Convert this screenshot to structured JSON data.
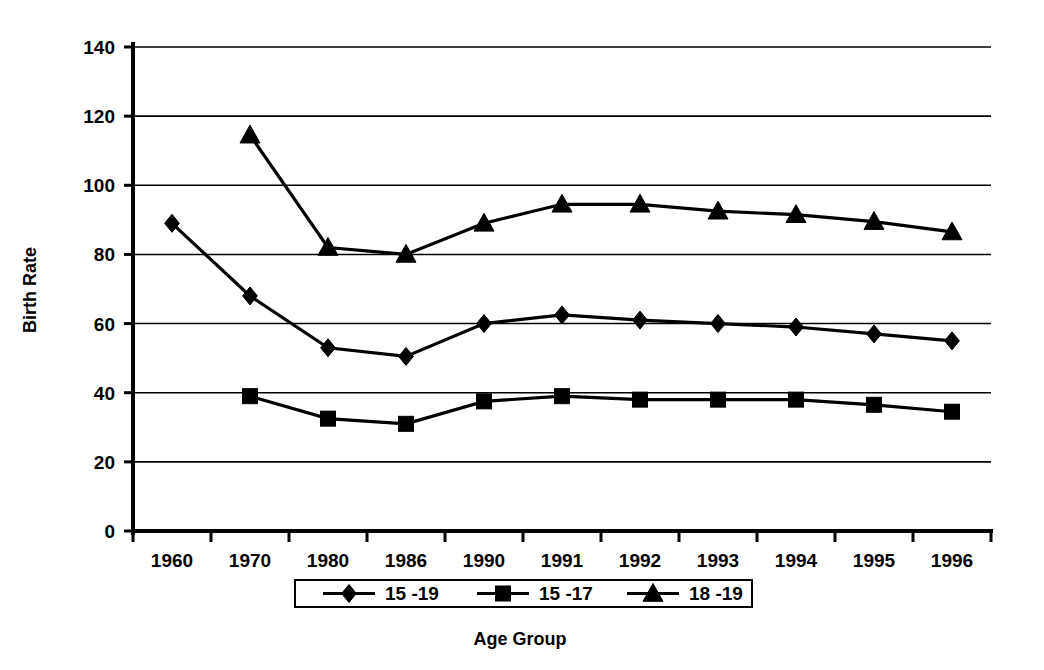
{
  "chart_data": {
    "type": "line",
    "title": "",
    "xlabel": "Age Group",
    "ylabel": "Birth Rate",
    "categories": [
      "1960",
      "1970",
      "1980",
      "1986",
      "1990",
      "1991",
      "1992",
      "1993",
      "1994",
      "1995",
      "1996"
    ],
    "ylim": [
      0,
      140
    ],
    "yticks": [
      "0",
      "20",
      "40",
      "60",
      "80",
      "100",
      "120",
      "140"
    ],
    "ytick_values": [
      0,
      20,
      40,
      60,
      80,
      100,
      120,
      140
    ],
    "grid": "horizontal",
    "legend_position": "bottom",
    "series": [
      {
        "name": "15 -19",
        "marker": "diamond",
        "values": [
          89,
          68,
          53,
          50.5,
          60,
          62.5,
          61,
          60,
          59,
          57,
          55
        ]
      },
      {
        "name": "15 -17",
        "marker": "square",
        "values": [
          null,
          39,
          32.5,
          31,
          37.5,
          39,
          38,
          38,
          38,
          36.5,
          34.5
        ]
      },
      {
        "name": "18 -19",
        "marker": "triangle",
        "values": [
          null,
          114.5,
          82,
          80,
          89,
          94.5,
          94.5,
          92.5,
          91.5,
          89.5,
          86.5
        ]
      }
    ]
  },
  "legend": {
    "entries": [
      {
        "label": "15 -19",
        "marker": "diamond-icon"
      },
      {
        "label": "15 -17",
        "marker": "square-icon"
      },
      {
        "label": "18 -19",
        "marker": "triangle-icon"
      }
    ]
  },
  "colors": {
    "ink": "#000000",
    "background": "#ffffff"
  }
}
